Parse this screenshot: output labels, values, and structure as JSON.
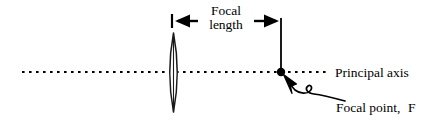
{
  "figure": {
    "type": "optics-ray-diagram",
    "background_color": "#ffffff",
    "stroke_color": "#000000"
  },
  "labels": {
    "focal_length_line1": "Focal",
    "focal_length_line2": "length",
    "principal_axis": "Principal axis",
    "focal_point_text": "Focal point,",
    "focal_point_symbol": "F"
  },
  "elements": {
    "lens": {
      "name": "converging-lens",
      "center_x": 173.5,
      "top_y": 33,
      "bottom_y": 112,
      "half_width": 7
    },
    "principal_axis": {
      "name": "principal-axis-dotted-line",
      "y": 72,
      "x_start": 22,
      "x_end": 328,
      "style": "dotted"
    },
    "focal_point": {
      "name": "focal-point-dot",
      "x": 281,
      "y": 72,
      "radius": 4
    },
    "focal_plane_line": {
      "name": "focal-plane-vertical-line",
      "x": 281,
      "y_top": 18,
      "y_bottom": 72
    },
    "measure_arrow": {
      "name": "focal-length-measure-arrow",
      "y": 21,
      "left_tick_x": 172,
      "right_tick_x": 281,
      "left_tick_top": 14,
      "left_tick_bottom": 28
    },
    "callout": {
      "name": "focal-point-callout-arrow",
      "tip_x": 284,
      "tip_y": 75,
      "end_x": 345,
      "end_y": 101
    }
  }
}
